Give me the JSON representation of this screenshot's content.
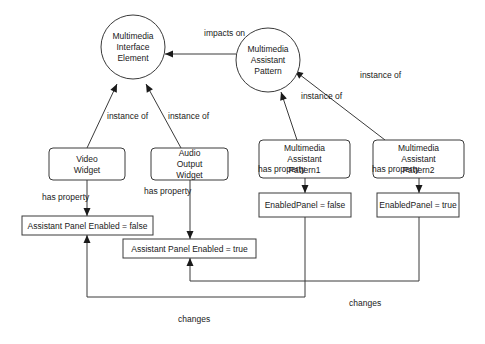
{
  "diagram": {
    "nodes": [
      {
        "id": "mie",
        "shape": "circle",
        "cx": 133,
        "cy": 47,
        "r": 32,
        "lines": [
          "Multimedia",
          "Interface",
          "Element"
        ]
      },
      {
        "id": "map",
        "shape": "circle",
        "cx": 268,
        "cy": 60,
        "r": 32,
        "lines": [
          "Multimedia",
          "Assistant",
          "Pattern"
        ]
      },
      {
        "id": "video-widget",
        "shape": "rounded-rect",
        "x": 49,
        "y": 148,
        "w": 76,
        "h": 32,
        "lines": [
          "Video",
          "Widget"
        ]
      },
      {
        "id": "audio-output-widget",
        "shape": "rounded-rect",
        "x": 151,
        "y": 148,
        "w": 77,
        "h": 32,
        "lines": [
          "Audio",
          "Output",
          "Widget"
        ]
      },
      {
        "id": "map1",
        "shape": "rounded-rect",
        "x": 259,
        "y": 140,
        "w": 91,
        "h": 38,
        "lines": [
          "Multimedia",
          "Assistant",
          "Pattern1"
        ]
      },
      {
        "id": "map2",
        "shape": "rounded-rect",
        "x": 373,
        "y": 140,
        "w": 91,
        "h": 38,
        "lines": [
          "Multimedia",
          "Assistant",
          "Pattern2"
        ]
      },
      {
        "id": "ape-false",
        "shape": "rect",
        "x": 22,
        "y": 216,
        "w": 131,
        "h": 19,
        "lines": [
          "Assistant Panel Enabled = false"
        ]
      },
      {
        "id": "ape-true",
        "shape": "rect",
        "x": 123,
        "y": 239,
        "w": 133,
        "h": 19,
        "lines": [
          "Assistant Panel Enabled = true"
        ]
      },
      {
        "id": "ep-false",
        "shape": "rect",
        "x": 259,
        "y": 193,
        "w": 92,
        "h": 24,
        "lines": [
          "EnabledPanel = false"
        ]
      },
      {
        "id": "ep-true",
        "shape": "rect",
        "x": 377,
        "y": 193,
        "w": 82,
        "h": 24,
        "lines": [
          "EnabledPanel = true"
        ]
      }
    ],
    "edges": [
      {
        "id": "impacts-on",
        "from": "map",
        "to": "mie",
        "label": "impacts on",
        "points": [
          [
            236,
            54
          ],
          [
            165,
            54
          ]
        ],
        "label_pos": [
          204,
          36
        ]
      },
      {
        "id": "video-instance-of",
        "from": "video-widget",
        "to": "mie",
        "label": "instance of",
        "points": [
          [
            87,
            148
          ],
          [
            117,
            84
          ]
        ],
        "label_pos": [
          107,
          119
        ]
      },
      {
        "id": "audio-instance-of",
        "from": "audio-output-widget",
        "to": "mie",
        "label": "instance of",
        "points": [
          [
            181,
            148
          ],
          [
            146,
            84
          ]
        ],
        "label_pos": [
          168,
          119
        ]
      },
      {
        "id": "map1-instance-of",
        "from": "map1",
        "to": "map",
        "label": "instance of",
        "points": [
          [
            297,
            140
          ],
          [
            281,
            92
          ]
        ],
        "label_pos": [
          301,
          99
        ]
      },
      {
        "id": "map2-instance-of",
        "from": "map2",
        "to": "map",
        "label": "instance of",
        "points": [
          [
            385,
            140
          ],
          [
            295,
            71
          ]
        ],
        "label_pos": [
          360,
          78
        ]
      },
      {
        "id": "video-has-property",
        "from": "video-widget",
        "to": "ape-false",
        "label": "has property",
        "points": [
          [
            87,
            180
          ],
          [
            87,
            216
          ]
        ],
        "label_pos": [
          42,
          200
        ]
      },
      {
        "id": "audio-has-property",
        "from": "audio-output-widget",
        "to": "ape-true",
        "label": "has property",
        "points": [
          [
            190,
            180
          ],
          [
            190,
            239
          ]
        ],
        "label_pos": [
          144,
          194
        ]
      },
      {
        "id": "map1-has-property",
        "from": "map1",
        "to": "ep-false",
        "label": "has property",
        "points": [
          [
            305,
            178
          ],
          [
            305,
            193
          ]
        ],
        "label_pos": [
          258,
          172
        ]
      },
      {
        "id": "map2-has-property",
        "from": "map2",
        "to": "ep-true",
        "label": "has property",
        "points": [
          [
            419,
            178
          ],
          [
            419,
            193
          ]
        ],
        "label_pos": [
          372,
          172
        ]
      },
      {
        "id": "ep-false-changes",
        "from": "ep-false",
        "to": "ape-false",
        "label": "changes",
        "points": [
          [
            305,
            217
          ],
          [
            305,
            297
          ],
          [
            87,
            297
          ],
          [
            87,
            235
          ]
        ],
        "label_pos": [
          178,
          322
        ]
      },
      {
        "id": "ep-true-changes",
        "from": "ep-true",
        "to": "ape-true",
        "label": "changes",
        "points": [
          [
            419,
            217
          ],
          [
            419,
            281
          ],
          [
            190,
            281
          ],
          [
            190,
            258
          ]
        ],
        "label_pos": [
          349,
          306
        ]
      }
    ]
  },
  "colors": {
    "stroke": "#3a3a3a",
    "text": "#1a1a1a",
    "background": "#ffffff"
  }
}
